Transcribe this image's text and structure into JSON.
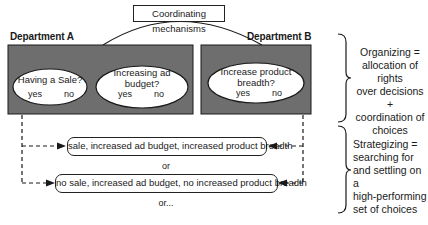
{
  "coordinating_mechanisms": "Coordinating mechanisms",
  "departments": [
    {
      "label": "Department A",
      "decisions": [
        {
          "question_lines": [
            "Having a Sale?"
          ],
          "yes": "yes",
          "no": "no"
        },
        {
          "question_lines": [
            "Increasing ad",
            "budget?"
          ],
          "yes": "yes",
          "no": "no"
        }
      ]
    },
    {
      "label": "Department B",
      "decisions": [
        {
          "question_lines": [
            "Increase product",
            "breadth?"
          ],
          "yes": "yes",
          "no": "no"
        }
      ]
    }
  ],
  "choice_sets": [
    "sale, increased ad budget, increased product breadth",
    "no sale, increased ad budget, no increased product breadth"
  ],
  "separators": [
    "or",
    "or..."
  ],
  "annotations": {
    "organizing": [
      "Organizing =",
      "allocation of rights",
      "over decisions +",
      "coordination of",
      "choices"
    ],
    "strategizing": [
      "Strategizing =",
      "searching for",
      "and settling on a",
      "high-performing",
      "set of choices"
    ]
  },
  "colors": {
    "department_fill": "#6e6e6e",
    "oval_fill": "#ffffff",
    "stroke": "#1a1a1a"
  }
}
